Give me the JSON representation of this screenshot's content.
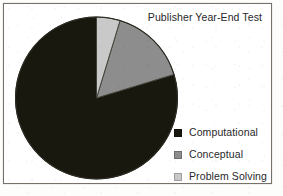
{
  "chart_data": {
    "type": "pie",
    "title": "Publisher Year-End Test",
    "categories": [
      "Computational",
      "Conceptual",
      "Problem Solving"
    ],
    "values": [
      79.7,
      15.6,
      4.7
    ],
    "units": "percent",
    "start_angle_deg": 90,
    "direction": "counterclockwise",
    "legend_position": "right",
    "grid": false,
    "slice_colors": [
      "#18180f",
      "#8d8d8d",
      "#c9c9c9"
    ],
    "slices": [
      {
        "label": "Computational",
        "value": 79.7,
        "color": "#18180f",
        "sweep_deg": 287.0,
        "swatch_name": "legend-swatch-computational"
      },
      {
        "label": "Conceptual",
        "value": 15.6,
        "color": "#8d8d8d",
        "sweep_deg": 56.0,
        "swatch_name": "legend-swatch-conceptual"
      },
      {
        "label": "Problem Solving",
        "value": 4.7,
        "color": "#c9c9c9",
        "sweep_deg": 17.0,
        "swatch_name": "legend-swatch-problem-solving"
      }
    ]
  },
  "chart": {
    "title": "Publisher Year-End Test",
    "frame_border_color": "#777069",
    "background_color": "#ffffff",
    "text_color": "#28282a"
  },
  "legend": {
    "entries": [
      {
        "label": "Computational",
        "color": "#18180f"
      },
      {
        "label": "Conceptual",
        "color": "#8d8d8d"
      },
      {
        "label": "Problem Solving",
        "color": "#c9c9c9"
      }
    ]
  }
}
